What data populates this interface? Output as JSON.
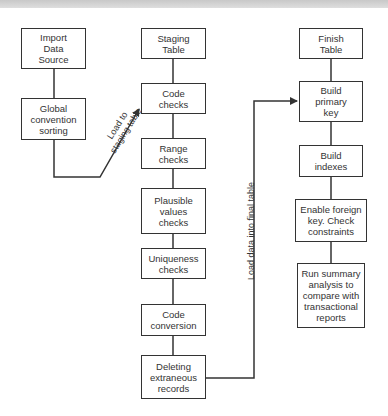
{
  "diagram": {
    "type": "flowchart",
    "columns": [
      {
        "id": "source",
        "steps": [
          {
            "id": "import-data-source",
            "label": "Import\nData\nSource"
          },
          {
            "id": "global-convention-sorting",
            "label": "Global\nconvention\nsorting"
          }
        ]
      },
      {
        "id": "staging",
        "steps": [
          {
            "id": "staging-table",
            "label": "Staging\nTable"
          },
          {
            "id": "code-checks",
            "label": "Code\nchecks"
          },
          {
            "id": "range-checks",
            "label": "Range\nchecks"
          },
          {
            "id": "plausible-values-checks",
            "label": "Plausible\nvalues\nchecks"
          },
          {
            "id": "uniqueness-checks",
            "label": "Uniqueness\nchecks"
          },
          {
            "id": "code-conversion",
            "label": "Code\nconversion"
          },
          {
            "id": "deleting-extraneous-records",
            "label": "Deleting\nextraneous\nrecords"
          }
        ]
      },
      {
        "id": "finish",
        "steps": [
          {
            "id": "finish-table",
            "label": "Finish\nTable"
          },
          {
            "id": "build-primary-key",
            "label": "Build\nprimary\nkey"
          },
          {
            "id": "build-indexes",
            "label": "Build\nindexes"
          },
          {
            "id": "enable-foreign-key",
            "label": "Enable foreign\nkey. Check\nconstraints"
          },
          {
            "id": "run-summary-analysis",
            "label": "Run summary\nanalysis to\ncompare with\ntransactional\nreports"
          }
        ]
      }
    ],
    "edges": [
      {
        "from": "global-convention-sorting",
        "to": "code-checks",
        "label": "Load to\nstaging table"
      },
      {
        "from": "deleting-extraneous-records",
        "to": "build-primary-key",
        "label": "Load data into final table"
      }
    ]
  },
  "colors": {
    "line": "#333333",
    "text": "#333333",
    "background": "#ffffff",
    "top_strip": "#cccccc"
  }
}
